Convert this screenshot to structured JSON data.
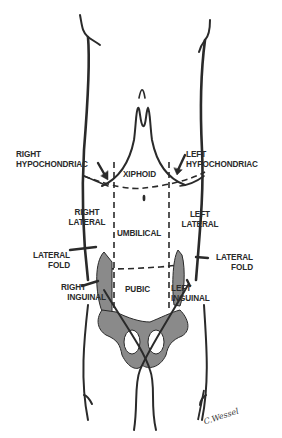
{
  "diagram": {
    "type": "anatomical-diagram",
    "colors": {
      "line": "#2a2a2a",
      "bone_fill": "#8a8a8a",
      "background": "#ffffff"
    },
    "regions": {
      "right_hypochondriac": [
        "RIGHT",
        "HYPOCHONDRIAC"
      ],
      "left_hypochondriac": [
        "LEFT",
        "HYPOCHONDRIAC"
      ],
      "xiphoid": "XIPHOID",
      "right_lateral": [
        "RIGHT",
        "LATERAL"
      ],
      "left_lateral": [
        "LEFT",
        "LATERAL"
      ],
      "umbilical": "UMBILICAL",
      "right_lateral_fold": [
        "LATERAL",
        "FOLD"
      ],
      "left_lateral_fold": [
        "LATERAL",
        "FOLD"
      ],
      "right_inguinal": [
        "RIGHT",
        "INGUINAL"
      ],
      "left_inguinal": [
        "LEFT",
        "INGUINAL"
      ],
      "pubic": "PUBIC"
    },
    "signature": "C.Wessel"
  }
}
